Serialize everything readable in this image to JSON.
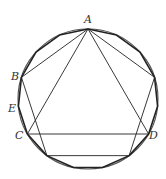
{
  "diagram": {
    "colors": {
      "stroke": "#222222",
      "circle": "#555555",
      "background": "#ffffff"
    },
    "circle": {
      "cx": 88,
      "cy": 99,
      "r": 70
    },
    "labels": {
      "A": "A",
      "B": "B",
      "C": "C",
      "D": "D",
      "E": "E"
    },
    "shapes": [
      {
        "name": "circle"
      },
      {
        "name": "regular-15-gon",
        "sides": 15
      },
      {
        "name": "regular-pentagon",
        "sides": 5,
        "vertices": [
          "A",
          "B",
          "",
          "",
          ""
        ]
      },
      {
        "name": "equilateral-triangle",
        "sides": 3,
        "vertices": [
          "A",
          "C",
          "D"
        ]
      }
    ]
  }
}
